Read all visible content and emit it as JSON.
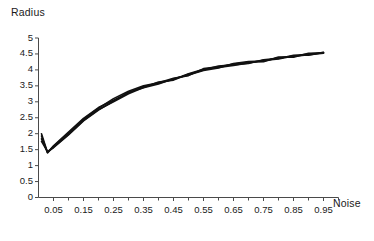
{
  "chart_data": {
    "type": "line",
    "title": "",
    "xlabel": "Noise",
    "ylabel": "Radius",
    "xlim": [
      0.0,
      1.0
    ],
    "ylim": [
      0,
      5
    ],
    "grid": false,
    "legend": null,
    "xticks": [
      "0.05",
      "0.15",
      "0.25",
      "0.35",
      "0.45",
      "0.55",
      "0.65",
      "0.75",
      "0.85",
      "0.95"
    ],
    "xtick_values": [
      0.05,
      0.15,
      0.25,
      0.35,
      0.45,
      0.55,
      0.65,
      0.75,
      0.85,
      0.95
    ],
    "yticks": [
      "0",
      "0.5",
      "1",
      "1.5",
      "2",
      "2.5",
      "3",
      "3.5",
      "4",
      "4.5",
      "5"
    ],
    "ytick_values": [
      0,
      0.5,
      1,
      1.5,
      2,
      2.5,
      3,
      3.5,
      4,
      4.5,
      5
    ],
    "x": [
      0.01,
      0.03,
      0.05,
      0.1,
      0.15,
      0.2,
      0.25,
      0.3,
      0.35,
      0.4,
      0.45,
      0.5,
      0.55,
      0.6,
      0.65,
      0.7,
      0.75,
      0.8,
      0.85,
      0.9,
      0.95
    ],
    "series": [
      {
        "name": "run-1",
        "color": "#111111",
        "values": [
          2.0,
          1.41,
          1.62,
          2.05,
          2.48,
          2.82,
          3.05,
          3.28,
          3.48,
          3.58,
          3.7,
          3.88,
          4.02,
          4.08,
          4.14,
          4.22,
          4.3,
          4.34,
          4.44,
          4.5,
          4.54
        ]
      },
      {
        "name": "run-2",
        "color": "#111111",
        "values": [
          1.93,
          1.4,
          1.6,
          2.02,
          2.45,
          2.8,
          3.1,
          3.33,
          3.5,
          3.6,
          3.74,
          3.82,
          4.04,
          4.1,
          4.18,
          4.24,
          4.26,
          4.4,
          4.4,
          4.52,
          4.53
        ]
      },
      {
        "name": "run-3",
        "color": "#111111",
        "values": [
          1.84,
          1.42,
          1.58,
          1.98,
          2.42,
          2.76,
          3.0,
          3.25,
          3.45,
          3.62,
          3.68,
          3.86,
          4.0,
          4.12,
          4.16,
          4.2,
          4.32,
          4.36,
          4.46,
          4.46,
          4.55
        ]
      },
      {
        "name": "run-4",
        "color": "#111111",
        "values": [
          1.76,
          1.44,
          1.56,
          1.96,
          2.4,
          2.74,
          3.02,
          3.3,
          3.44,
          3.56,
          3.72,
          3.84,
          3.98,
          4.06,
          4.2,
          4.26,
          4.28,
          4.38,
          4.42,
          4.48,
          4.52
        ]
      }
    ]
  },
  "axes": {
    "axis_color": "#4a4a4a",
    "line_color": "#111111"
  }
}
